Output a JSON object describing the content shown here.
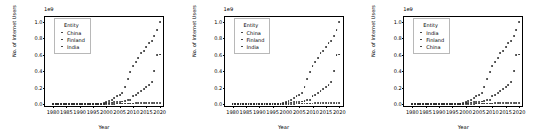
{
  "figure": {
    "width": 539,
    "height": 135,
    "background": "#ffffff",
    "marker_color": "#2b2b2b",
    "panel_count": 3
  },
  "chart_data": [
    {
      "type": "scatter",
      "title": "",
      "xlabel": "Year",
      "ylabel": "No. of Internet Users",
      "offset_text": "1e9",
      "xlim": [
        1977,
        2022
      ],
      "ylim": [
        -0.05,
        1.06
      ],
      "xticks": [
        "1980",
        "1985",
        "1990",
        "1995",
        "2000",
        "2005",
        "2010",
        "2015",
        "2020"
      ],
      "xtick_values": [
        1980,
        1985,
        1990,
        1995,
        2000,
        2005,
        2010,
        2015,
        2020
      ],
      "yticks": [
        "0.0",
        "0.2",
        "0.4",
        "0.6",
        "0.8",
        "1.0"
      ],
      "ytick_values": [
        0.0,
        0.2,
        0.4,
        0.6,
        0.8,
        1.0
      ],
      "grid": false,
      "legend": {
        "title": "Entity",
        "position": "upper left",
        "entries": [
          "China",
          "Finland",
          "India"
        ]
      },
      "x": [
        1980,
        1981,
        1982,
        1983,
        1984,
        1985,
        1986,
        1987,
        1988,
        1989,
        1990,
        1991,
        1992,
        1993,
        1994,
        1995,
        1996,
        1997,
        1998,
        1999,
        2000,
        2001,
        2002,
        2003,
        2004,
        2005,
        2006,
        2007,
        2008,
        2009,
        2010,
        2011,
        2012,
        2013,
        2014,
        2015,
        2016,
        2017,
        2018,
        2019,
        2020
      ],
      "series": [
        {
          "name": "China",
          "values": [
            0,
            0,
            0,
            0,
            0,
            0,
            0,
            0,
            0,
            0,
            0,
            0,
            0,
            0,
            0,
            0,
            0.0002,
            0.0006,
            0.0021,
            0.0089,
            0.0225,
            0.0337,
            0.046,
            0.0692,
            0.094,
            0.111,
            0.137,
            0.21,
            0.3,
            0.386,
            0.457,
            0.513,
            0.564,
            0.618,
            0.649,
            0.688,
            0.738,
            0.772,
            0.829,
            0.905,
            1.0
          ]
        },
        {
          "name": "Finland",
          "values": [
            0,
            0,
            0,
            0,
            0,
            0,
            0,
            0,
            0,
            0,
            0,
            0.0001,
            0.0002,
            0.0003,
            0.0006,
            0.0007,
            0.0009,
            0.001,
            0.0011,
            0.0017,
            0.0019,
            0.0022,
            0.0032,
            0.0033,
            0.0038,
            0.0039,
            0.0041,
            0.0043,
            0.0044,
            0.0045,
            0.0047,
            0.0049,
            0.005,
            0.0051,
            0.0052,
            0.0053,
            0.0054,
            0.0055,
            0.0056,
            0.0057,
            0.0058
          ]
        },
        {
          "name": "India",
          "values": [
            0,
            0,
            0,
            0,
            0,
            0,
            0,
            0,
            0,
            0,
            0,
            0,
            0,
            0,
            0,
            0,
            0.0002,
            0.0007,
            0.0014,
            0.0027,
            0.0055,
            0.0072,
            0.0165,
            0.018,
            0.02,
            0.025,
            0.029,
            0.04,
            0.051,
            0.052,
            0.092,
            0.108,
            0.127,
            0.153,
            0.178,
            0.202,
            0.23,
            0.268,
            0.406,
            0.601,
            0.602
          ]
        }
      ]
    },
    {
      "type": "scatter",
      "title": "",
      "xlabel": "Year",
      "ylabel": "No. of Internet Users",
      "offset_text": "1e9",
      "xlim": [
        1977,
        2022
      ],
      "ylim": [
        -0.05,
        1.06
      ],
      "xticks": [
        "1980",
        "1985",
        "1990",
        "1995",
        "2000",
        "2005",
        "2010",
        "2015",
        "2020"
      ],
      "xtick_values": [
        1980,
        1985,
        1990,
        1995,
        2000,
        2005,
        2010,
        2015,
        2020
      ],
      "yticks": [
        "0.0",
        "0.2",
        "0.4",
        "0.6",
        "0.8",
        "1.0"
      ],
      "ytick_values": [
        0.0,
        0.2,
        0.4,
        0.6,
        0.8,
        1.0
      ],
      "grid": false,
      "legend": {
        "title": "Entity",
        "position": "upper left",
        "entries": [
          "China",
          "Finland",
          "India"
        ]
      },
      "x": [
        1980,
        1981,
        1982,
        1983,
        1984,
        1985,
        1986,
        1987,
        1988,
        1989,
        1990,
        1991,
        1992,
        1993,
        1994,
        1995,
        1996,
        1997,
        1998,
        1999,
        2000,
        2001,
        2002,
        2003,
        2004,
        2005,
        2006,
        2007,
        2008,
        2009,
        2010,
        2011,
        2012,
        2013,
        2014,
        2015,
        2016,
        2017,
        2018,
        2019,
        2020
      ],
      "series": [
        {
          "name": "China",
          "values": [
            0,
            0,
            0,
            0,
            0,
            0,
            0,
            0,
            0,
            0,
            0,
            0,
            0,
            0,
            0,
            0,
            0.0002,
            0.0006,
            0.0021,
            0.0089,
            0.0225,
            0.0337,
            0.046,
            0.0692,
            0.094,
            0.111,
            0.137,
            0.21,
            0.3,
            0.386,
            0.457,
            0.513,
            0.564,
            0.618,
            0.649,
            0.688,
            0.738,
            0.772,
            0.829,
            0.905,
            1.0
          ]
        },
        {
          "name": "Finland",
          "values": [
            0,
            0,
            0,
            0,
            0,
            0,
            0,
            0,
            0,
            0,
            0,
            0.0001,
            0.0002,
            0.0003,
            0.0006,
            0.0007,
            0.0009,
            0.001,
            0.0011,
            0.0017,
            0.0019,
            0.0022,
            0.0032,
            0.0033,
            0.0038,
            0.0039,
            0.0041,
            0.0043,
            0.0044,
            0.0045,
            0.0047,
            0.0049,
            0.005,
            0.0051,
            0.0052,
            0.0053,
            0.0054,
            0.0055,
            0.0056,
            0.0057,
            0.0058
          ]
        },
        {
          "name": "India",
          "values": [
            0,
            0,
            0,
            0,
            0,
            0,
            0,
            0,
            0,
            0,
            0,
            0,
            0,
            0,
            0,
            0,
            0.0002,
            0.0007,
            0.0014,
            0.0027,
            0.0055,
            0.0072,
            0.0165,
            0.018,
            0.02,
            0.025,
            0.029,
            0.04,
            0.051,
            0.052,
            0.092,
            0.108,
            0.127,
            0.153,
            0.178,
            0.202,
            0.23,
            0.268,
            0.406,
            0.601,
            0.602
          ]
        }
      ]
    },
    {
      "type": "scatter",
      "title": "",
      "xlabel": "Year",
      "ylabel": "No. of Internet Users",
      "offset_text": "1e9",
      "xlim": [
        1977,
        2022
      ],
      "ylim": [
        -0.05,
        1.06
      ],
      "xticks": [
        "1980",
        "1985",
        "1990",
        "1995",
        "2000",
        "2005",
        "2010",
        "2015",
        "2020"
      ],
      "xtick_values": [
        1980,
        1985,
        1990,
        1995,
        2000,
        2005,
        2010,
        2015,
        2020
      ],
      "yticks": [
        "0.0",
        "0.2",
        "0.4",
        "0.6",
        "0.8",
        "1.0"
      ],
      "ytick_values": [
        0.0,
        0.2,
        0.4,
        0.6,
        0.8,
        1.0
      ],
      "grid": false,
      "legend": {
        "title": "Entity",
        "position": "upper left",
        "entries": [
          "India",
          "Finland",
          "China"
        ]
      },
      "x": [
        1980,
        1981,
        1982,
        1983,
        1984,
        1985,
        1986,
        1987,
        1988,
        1989,
        1990,
        1991,
        1992,
        1993,
        1994,
        1995,
        1996,
        1997,
        1998,
        1999,
        2000,
        2001,
        2002,
        2003,
        2004,
        2005,
        2006,
        2007,
        2008,
        2009,
        2010,
        2011,
        2012,
        2013,
        2014,
        2015,
        2016,
        2017,
        2018,
        2019,
        2020
      ],
      "series": [
        {
          "name": "India",
          "values": [
            0,
            0,
            0,
            0,
            0,
            0,
            0,
            0,
            0,
            0,
            0,
            0,
            0,
            0,
            0,
            0,
            0.0002,
            0.0007,
            0.0014,
            0.0027,
            0.0055,
            0.0072,
            0.0165,
            0.018,
            0.02,
            0.025,
            0.029,
            0.04,
            0.051,
            0.052,
            0.092,
            0.108,
            0.127,
            0.153,
            0.178,
            0.202,
            0.23,
            0.268,
            0.406,
            0.601,
            0.602
          ]
        },
        {
          "name": "Finland",
          "values": [
            0,
            0,
            0,
            0,
            0,
            0,
            0,
            0,
            0,
            0,
            0,
            0.0001,
            0.0002,
            0.0003,
            0.0006,
            0.0007,
            0.0009,
            0.001,
            0.0011,
            0.0017,
            0.0019,
            0.0022,
            0.0032,
            0.0033,
            0.0038,
            0.0039,
            0.0041,
            0.0043,
            0.0044,
            0.0045,
            0.0047,
            0.0049,
            0.005,
            0.0051,
            0.0052,
            0.0053,
            0.0054,
            0.0055,
            0.0056,
            0.0057,
            0.0058
          ]
        },
        {
          "name": "China",
          "values": [
            0,
            0,
            0,
            0,
            0,
            0,
            0,
            0,
            0,
            0,
            0,
            0,
            0,
            0,
            0,
            0,
            0.0002,
            0.0006,
            0.0021,
            0.0089,
            0.0225,
            0.0337,
            0.046,
            0.0692,
            0.094,
            0.111,
            0.137,
            0.21,
            0.3,
            0.386,
            0.457,
            0.513,
            0.564,
            0.618,
            0.649,
            0.688,
            0.738,
            0.772,
            0.829,
            0.905,
            1.0
          ]
        }
      ]
    }
  ]
}
